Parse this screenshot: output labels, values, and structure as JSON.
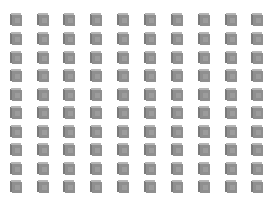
{
  "grid": {
    "rows": 10,
    "columns": 10,
    "icon": "cube-icon",
    "colors": {
      "front": "#8f8f8f",
      "top": "#b4b4b4",
      "side": "#7a7a7a",
      "background": "#ffffff"
    },
    "column_x": [
      10,
      37,
      63,
      90,
      117,
      144,
      171,
      198,
      225,
      251
    ],
    "row_y": [
      13,
      32,
      51,
      69,
      88,
      106,
      125,
      143,
      162,
      180
    ]
  }
}
